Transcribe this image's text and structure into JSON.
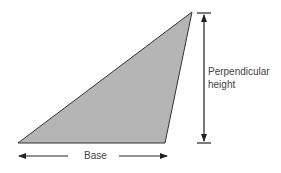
{
  "diagram": {
    "type": "triangle-area",
    "shape_fill": "#b3b3b3",
    "stroke": "#222222",
    "labels": {
      "height_line1": "Perpendicular",
      "height_line2": "height",
      "base": "Base"
    }
  }
}
